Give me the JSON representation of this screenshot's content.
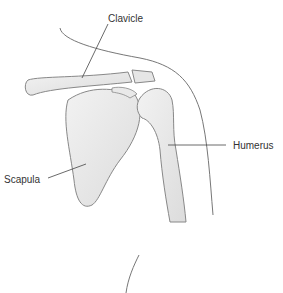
{
  "diagram": {
    "labels": {
      "clavicle": "Clavicle",
      "humerus": "Humerus",
      "scapula": "Scapula"
    },
    "colors": {
      "bone_fill": "#ededed",
      "bone_shade": "#d6d6d6",
      "outline": "#7a7a7a",
      "leader": "#444444",
      "text": "#333333"
    }
  }
}
